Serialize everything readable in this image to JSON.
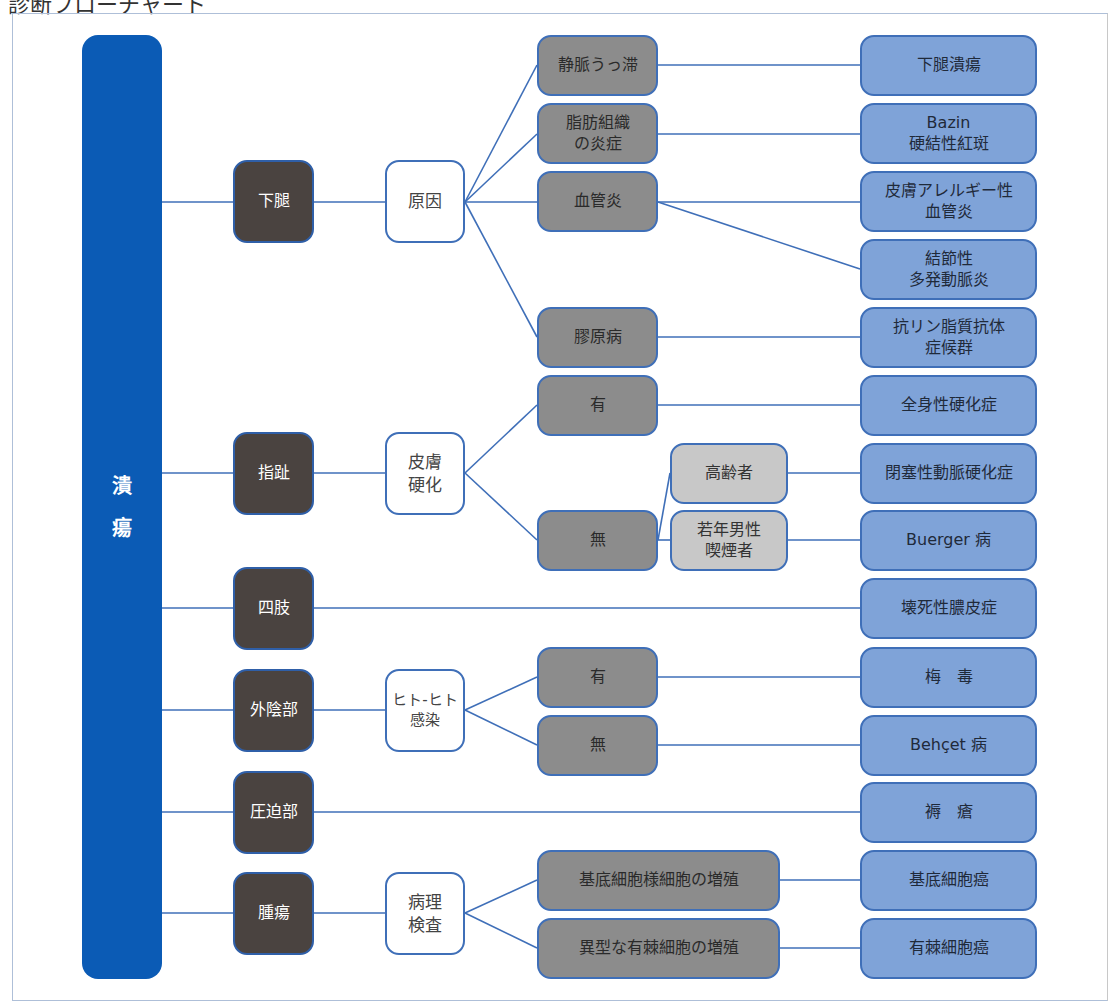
{
  "header": {
    "title": "診断フローチャート"
  },
  "colors": {
    "root": "#0b5bb5",
    "region_node": "#4a4340",
    "criterion_node": "#ffffff",
    "finding_node": "#8c8c8c",
    "subfinding_node": "#c8c8c8",
    "diagnosis_node": "#7fa3d8",
    "connector": "#3f6fb8"
  },
  "root": {
    "label_1": "潰",
    "label_2": "瘍"
  },
  "regions": [
    {
      "label": "下腿"
    },
    {
      "label": "指趾"
    },
    {
      "label": "四肢"
    },
    {
      "label": "外陰部"
    },
    {
      "label": "圧迫部"
    },
    {
      "label": "腫瘍"
    }
  ],
  "criteria": [
    {
      "label": "原因"
    },
    {
      "label": "皮膚\n硬化"
    },
    {
      "label": "ヒト-ヒト\n感染"
    },
    {
      "label": "病理\n検査"
    }
  ],
  "findings": [
    {
      "label": "静脈うっ滞"
    },
    {
      "label": "脂肪組織\nの炎症"
    },
    {
      "label": "血管炎"
    },
    {
      "label": "膠原病"
    },
    {
      "label": "有"
    },
    {
      "label": "無"
    },
    {
      "label": "有"
    },
    {
      "label": "無"
    },
    {
      "label": "基底細胞様細胞の増殖"
    },
    {
      "label": "異型な有棘細胞の増殖"
    }
  ],
  "subfindings": [
    {
      "label": "高齢者"
    },
    {
      "label": "若年男性\n喫煙者"
    }
  ],
  "diagnoses": [
    {
      "label": "下腿潰瘍"
    },
    {
      "label": "Bazin\n硬結性紅斑"
    },
    {
      "label": "皮膚アレルギー性\n血管炎"
    },
    {
      "label": "結節性\n多発動脈炎"
    },
    {
      "label": "抗リン脂質抗体\n症候群"
    },
    {
      "label": "全身性硬化症"
    },
    {
      "label": "閉塞性動脈硬化症"
    },
    {
      "label": "Buerger 病"
    },
    {
      "label": "壊死性膿皮症"
    },
    {
      "label": "梅　毒"
    },
    {
      "label": "Behçet 病"
    },
    {
      "label": "褥　瘡"
    },
    {
      "label": "基底細胞癌"
    },
    {
      "label": "有棘細胞癌"
    }
  ]
}
